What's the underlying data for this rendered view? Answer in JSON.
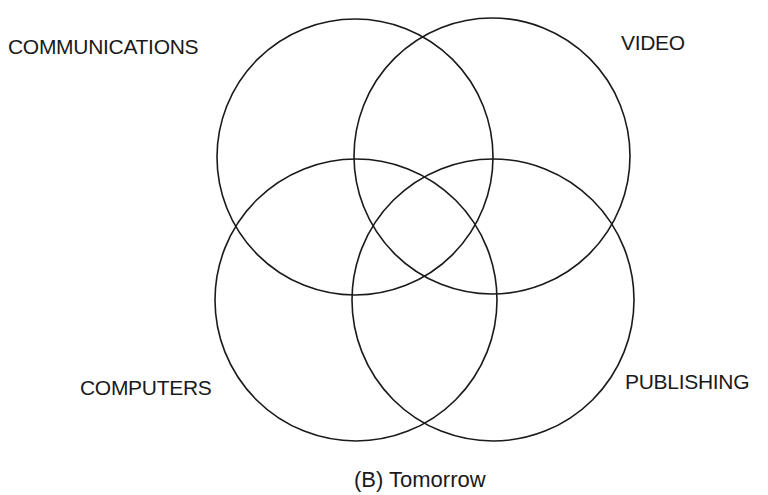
{
  "diagram": {
    "type": "venn",
    "caption": "(B) Tomorrow",
    "stroke_color": "#1a1a1a",
    "background": "#ffffff",
    "sets": [
      {
        "label": "COMMUNICATIONS",
        "position": "top-left"
      },
      {
        "label": "VIDEO",
        "position": "top-right"
      },
      {
        "label": "COMPUTERS",
        "position": "bottom-left"
      },
      {
        "label": "PUBLISHING",
        "position": "bottom-right"
      }
    ]
  }
}
